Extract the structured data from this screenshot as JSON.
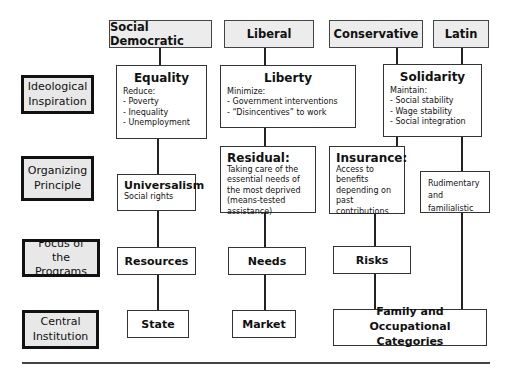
{
  "columns": [
    {
      "id": "social-democratic",
      "header": "Social Democratic"
    },
    {
      "id": "liberal",
      "header": "Liberal"
    },
    {
      "id": "conservative",
      "header": "Conservative"
    },
    {
      "id": "latin",
      "header": "Latin"
    }
  ],
  "row_labels": {
    "ideological": "Ideological Inspiration",
    "organizing": "Organizing Principle",
    "focus": "Focus of the Programs",
    "central": "Central Institution"
  },
  "ideological": {
    "equality": {
      "title": "Equality",
      "intro": "Reduce:",
      "items": [
        "- Poverty",
        "- Inequality",
        "- Unemployment"
      ]
    },
    "liberty": {
      "title": "Liberty",
      "intro": "Minimize:",
      "items": [
        "- Government interventions",
        "- “Disincentives” to work"
      ]
    },
    "solidarity": {
      "title": "Solidarity",
      "intro": "Maintain:",
      "items": [
        "- Social stability",
        "- Wage stability",
        "- Social integration"
      ]
    }
  },
  "organizing": {
    "universalism": {
      "title": "Universalism",
      "desc": "Social rights"
    },
    "residual": {
      "title": "Residual:",
      "desc": "Taking care of the essential needs of the most deprived (means-tested assistance)"
    },
    "insurance": {
      "title": "Insurance:",
      "desc": "Access to benefits depending on past contributions"
    },
    "rudimentary": {
      "lines": [
        "Rudimentary",
        "and",
        "familialistic"
      ]
    }
  },
  "focus": {
    "resources": "Resources",
    "needs": "Needs",
    "risks": "Risks"
  },
  "central": {
    "state": "State",
    "market": "Market",
    "family": "Family and Occupational Categories"
  }
}
